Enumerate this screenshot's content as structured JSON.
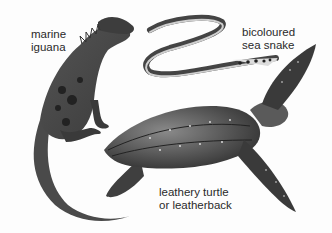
{
  "labels": {
    "iguana": "marine\niguana",
    "snake": "bicoloured\nsea snake",
    "turtle": "leathery turtle\nor leatherback"
  },
  "colors": {
    "background": "#fdfdfd",
    "ink": "#2a2a2a",
    "dark": "#333333",
    "mid": "#6b6b6b",
    "light": "#bdbdbd"
  }
}
